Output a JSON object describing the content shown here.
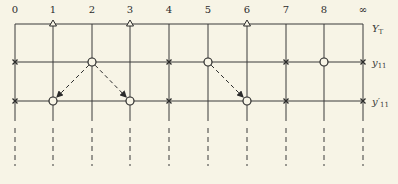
{
  "diagram": {
    "columns": [
      "0",
      "1",
      "2",
      "3",
      "4",
      "5",
      "6",
      "7",
      "8",
      "∞"
    ],
    "rows": [
      {
        "id": "YT",
        "label": "Y",
        "sub": "T"
      },
      {
        "id": "y11",
        "label": "y",
        "sub": "11"
      },
      {
        "id": "y11p",
        "label": "y′",
        "sub": "11"
      }
    ],
    "markers": {
      "YT": {
        "triangle": [
          1,
          3,
          6
        ]
      },
      "y11": {
        "cross": [
          0,
          4,
          7,
          9
        ],
        "circle": [
          2,
          5,
          8
        ]
      },
      "y11p": {
        "cross": [
          0,
          4,
          7,
          9
        ],
        "circle": [
          1,
          3,
          6
        ]
      }
    },
    "arrows": [
      {
        "from": {
          "row": "y11",
          "col": 2
        },
        "to": {
          "row": "y11p",
          "col": 1
        }
      },
      {
        "from": {
          "row": "y11",
          "col": 2
        },
        "to": {
          "row": "y11p",
          "col": 3
        }
      },
      {
        "from": {
          "row": "y11",
          "col": 5
        },
        "to": {
          "row": "y11p",
          "col": 6
        }
      }
    ],
    "colors": {
      "line": "#3a3a3a",
      "background": "#f7f4e6"
    }
  }
}
